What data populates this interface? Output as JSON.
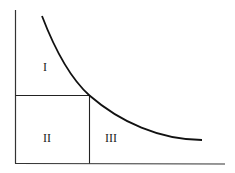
{
  "diagram": {
    "type": "area-under-curve",
    "regions": [
      {
        "id": "region-1",
        "label": "I"
      },
      {
        "id": "region-2",
        "label": "II"
      },
      {
        "id": "region-3",
        "label": "III"
      }
    ],
    "colors": {
      "line": "#222222",
      "curve": "#111111",
      "background": "#ffffff"
    }
  }
}
